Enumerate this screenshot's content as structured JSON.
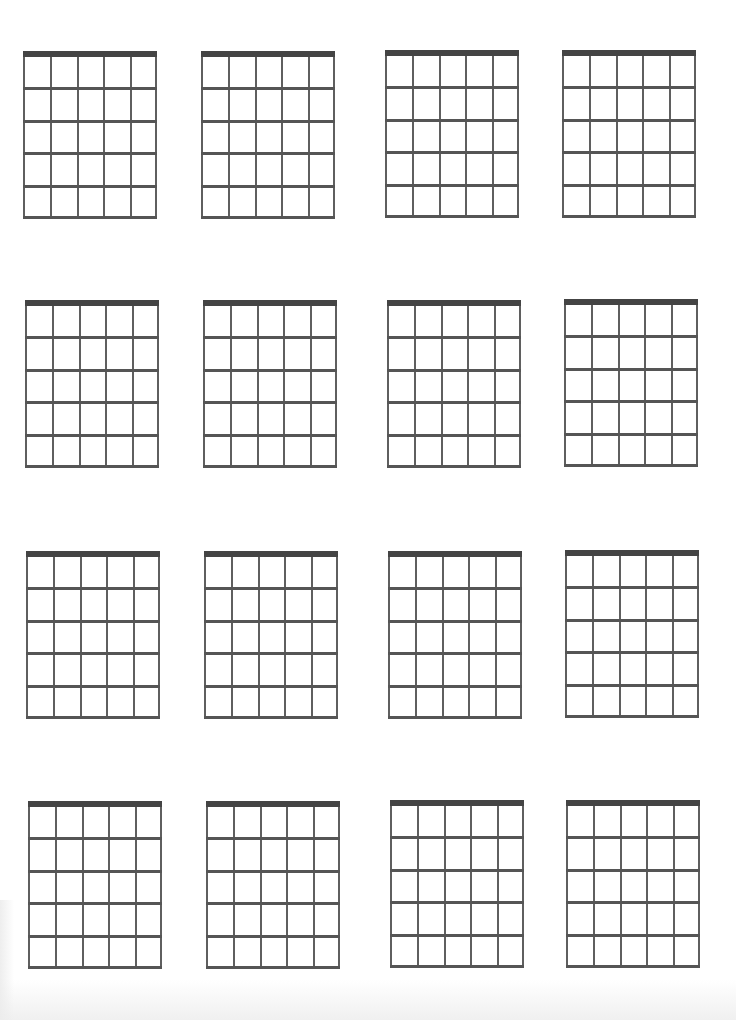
{
  "sheet": {
    "type": "blank guitar chord chart",
    "rows": 4,
    "columns": 4,
    "colors": {
      "background": "#ffffff",
      "nut": "#444444",
      "string": "#5f5f5f",
      "fret": "#555555"
    },
    "diagram": {
      "strings": 6,
      "frets": 5,
      "width": 134,
      "height": 168,
      "nut_thickness": 6
    },
    "diagrams": [
      {
        "name": "",
        "x": 23,
        "y": 51
      },
      {
        "name": "",
        "x": 201,
        "y": 51
      },
      {
        "name": "",
        "x": 385,
        "y": 50
      },
      {
        "name": "",
        "x": 562,
        "y": 50
      },
      {
        "name": "",
        "x": 25,
        "y": 300
      },
      {
        "name": "",
        "x": 203,
        "y": 300
      },
      {
        "name": "",
        "x": 387,
        "y": 300
      },
      {
        "name": "",
        "x": 564,
        "y": 299
      },
      {
        "name": "",
        "x": 26,
        "y": 551
      },
      {
        "name": "",
        "x": 204,
        "y": 551
      },
      {
        "name": "",
        "x": 388,
        "y": 551
      },
      {
        "name": "",
        "x": 565,
        "y": 550
      },
      {
        "name": "",
        "x": 28,
        "y": 801
      },
      {
        "name": "",
        "x": 206,
        "y": 801
      },
      {
        "name": "",
        "x": 390,
        "y": 800
      },
      {
        "name": "",
        "x": 566,
        "y": 800
      }
    ]
  }
}
